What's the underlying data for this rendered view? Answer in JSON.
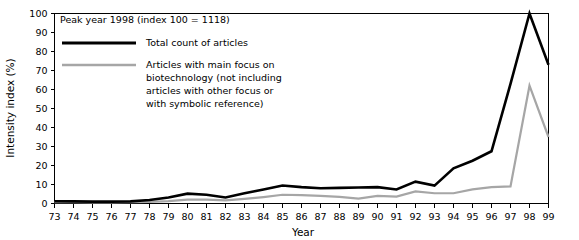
{
  "chart_data": {
    "type": "line",
    "title": "",
    "subtitle": "",
    "annotation": "Peak year 1998 (index 100 = 1118)",
    "xlabel": "Year",
    "ylabel": "Intensity index (%)",
    "xlim": [
      73,
      99
    ],
    "ylim": [
      0,
      100
    ],
    "grid": false,
    "legend_position": "top-left-inside",
    "categories": [
      "73",
      "74",
      "75",
      "76",
      "77",
      "78",
      "79",
      "80",
      "81",
      "82",
      "83",
      "84",
      "85",
      "86",
      "87",
      "88",
      "89",
      "90",
      "91",
      "92",
      "93",
      "94",
      "95",
      "96",
      "97",
      "98",
      "99"
    ],
    "xtick_labels": [
      "73",
      "74",
      "75",
      "76",
      "77",
      "78",
      "79",
      "80",
      "81",
      "82",
      "83",
      "84",
      "85",
      "86",
      "87",
      "88",
      "89",
      "90",
      "91",
      "92",
      "93",
      "94",
      "95",
      "96",
      "97",
      "98",
      "99"
    ],
    "ytick_labels": [
      "0",
      "10",
      "20",
      "30",
      "40",
      "50",
      "60",
      "70",
      "80",
      "90",
      "100"
    ],
    "yticks": [
      0,
      10,
      20,
      30,
      40,
      50,
      60,
      70,
      80,
      90,
      100
    ],
    "series": [
      {
        "name": "Total count of articles",
        "color": "#000000",
        "width": 2.6,
        "values": [
          1.2,
          1.1,
          1.0,
          1.0,
          1.1,
          1.8,
          3.2,
          5.2,
          4.6,
          3.2,
          5.4,
          7.4,
          9.5,
          8.6,
          8.0,
          8.2,
          8.4,
          8.6,
          7.4,
          11.5,
          9.4,
          18.5,
          22.5,
          27.5,
          63.0,
          100.0,
          73.0
        ]
      },
      {
        "name": "Articles with main focus on biotechnology (not including articles with other focus or with symbolic reference)",
        "color": "#a6a6a6",
        "width": 2.2,
        "values": [
          0.7,
          0.7,
          0.6,
          0.6,
          0.7,
          0.9,
          1.3,
          2.0,
          2.0,
          1.6,
          2.4,
          3.4,
          4.6,
          4.4,
          4.0,
          3.5,
          2.6,
          4.0,
          3.6,
          6.4,
          5.4,
          5.4,
          7.4,
          8.6,
          9.0,
          62.0,
          35.0
        ]
      }
    ]
  },
  "legend": {
    "entries": [
      {
        "label": "Total count of articles",
        "color": "#000000"
      },
      {
        "label": "Articles with main focus on",
        "color": "#a6a6a6"
      },
      {
        "label": "biotechnology (not including",
        "color": "#a6a6a6"
      },
      {
        "label": "articles with other focus or",
        "color": "#a6a6a6"
      },
      {
        "label": "with symbolic reference)",
        "color": "#a6a6a6"
      }
    ],
    "line1_label": "Total count of articles",
    "line2_label_1": "Articles with main focus on",
    "line2_label_2": "biotechnology (not including",
    "line2_label_3": "articles with other focus or",
    "line2_label_4": "with symbolic reference)"
  },
  "annotation": {
    "peak_note": "Peak year 1998 (index 100 = 1118)"
  },
  "axes": {
    "y_title": "Intensity index (%)",
    "x_title": "Year"
  },
  "colors": {
    "total_line": "#000000",
    "biotech_line": "#a6a6a6",
    "axis": "#000000",
    "background": "#ffffff"
  }
}
